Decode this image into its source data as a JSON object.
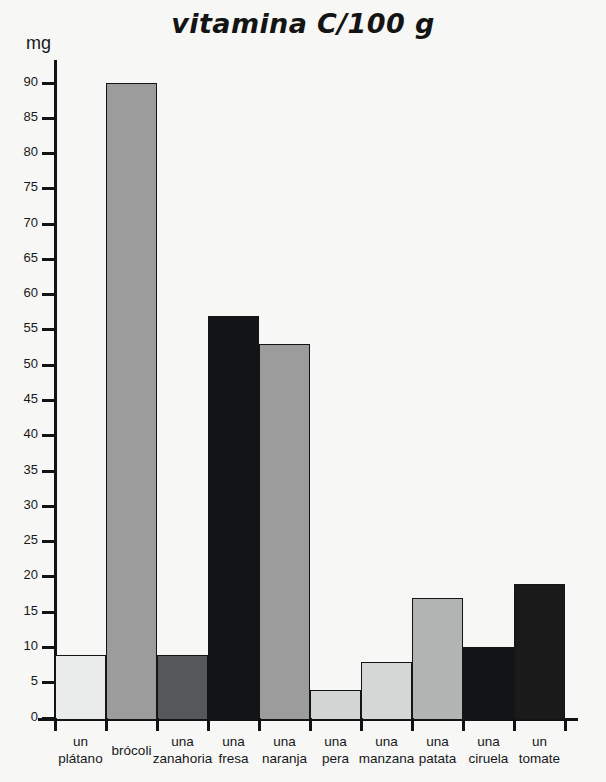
{
  "chart_data": {
    "type": "bar",
    "title": "vitamina C/100 g",
    "xlabel": "",
    "ylabel": "mg",
    "ylim": [
      0,
      90
    ],
    "ytick_step": 5,
    "yticks": [
      0,
      5,
      10,
      15,
      20,
      25,
      30,
      35,
      40,
      45,
      50,
      55,
      60,
      65,
      70,
      75,
      80,
      85,
      90
    ],
    "grid": false,
    "legend": "none",
    "categories": [
      "un plátano",
      "brócoli",
      "una zanahoria",
      "una fresa",
      "una naranja",
      "una pera",
      "una manzana",
      "una patata",
      "una ciruela",
      "un tomate"
    ],
    "category_lines": [
      [
        "un",
        "plátano"
      ],
      [
        "brócoli",
        ""
      ],
      [
        "una",
        "zanahoria"
      ],
      [
        "una",
        "fresa"
      ],
      [
        "una",
        "naranja"
      ],
      [
        "una",
        "pera"
      ],
      [
        "una",
        "manzana"
      ],
      [
        "una",
        "patata"
      ],
      [
        "una",
        "ciruela"
      ],
      [
        "un",
        "tomate"
      ]
    ],
    "values": [
      9,
      90,
      9,
      57,
      53,
      4,
      8,
      17,
      10,
      19
    ],
    "bar_colors": [
      "#e9eaea",
      "#9c9c9c",
      "#565759",
      "#131415",
      "#9c9c9c",
      "#d3d4d4",
      "#d5d6d6",
      "#b2b3b3",
      "#131415",
      "#1a1a1b"
    ],
    "bar_edge_color": "#121416",
    "axis_color": "#111314",
    "background_color": "#f7f7f5"
  }
}
